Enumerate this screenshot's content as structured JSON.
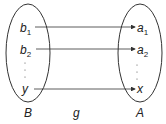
{
  "diagram": {
    "type": "function-mapping",
    "domain_set": {
      "label": "B",
      "elements": [
        {
          "name": "b",
          "sub": "1"
        },
        {
          "name": "b",
          "sub": "2"
        },
        {
          "name": "y",
          "sub": ""
        }
      ]
    },
    "codomain_set": {
      "label": "A",
      "elements": [
        {
          "name": "a",
          "sub": "1"
        },
        {
          "name": "a",
          "sub": "2"
        },
        {
          "name": "x",
          "sub": ""
        }
      ]
    },
    "function_label": "g",
    "mappings": [
      [
        "b1",
        "a1"
      ],
      [
        "b2",
        "a2"
      ],
      [
        "y",
        "x"
      ]
    ]
  }
}
